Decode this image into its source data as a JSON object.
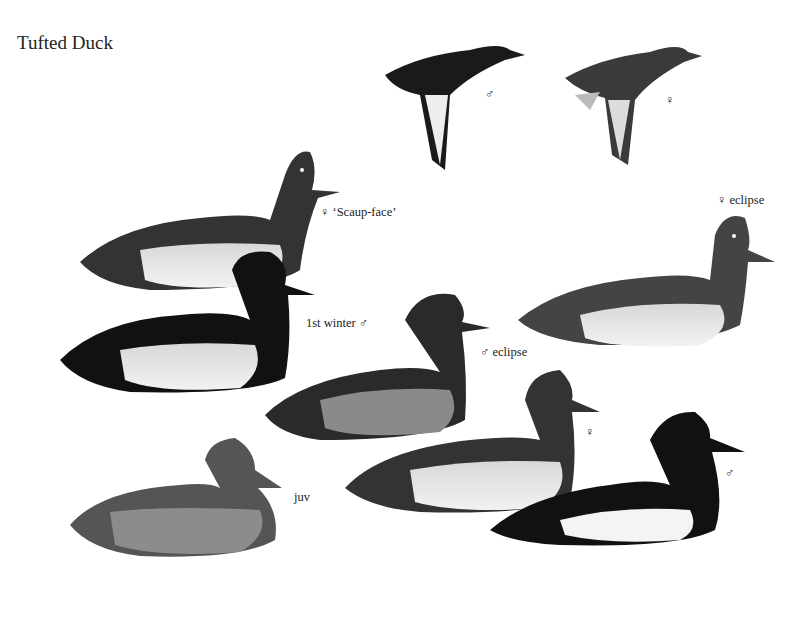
{
  "title": "Tufted Duck",
  "labels": {
    "fly_male": "♂",
    "fly_female": "♀",
    "scaup_face": "♀ ‘Scaup-face’",
    "female_eclipse": "♀ eclipse",
    "first_winter": "1st winter ♂",
    "male_eclipse": "♂ eclipse",
    "female": "♀",
    "male": "♂",
    "juv": "juv"
  }
}
